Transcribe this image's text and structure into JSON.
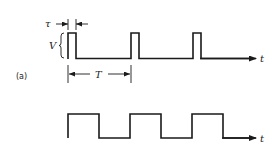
{
  "figure": {
    "panel_label": "(a)",
    "top_waveform": {
      "type": "pulse-train",
      "pulse_width_label": "τ",
      "amplitude_label": "V",
      "period_label": "T",
      "axis_label": "t",
      "pulse_count": 3
    },
    "bottom_waveform": {
      "type": "square-wave",
      "axis_label": "t",
      "high_segments": 3
    }
  },
  "colors": {
    "stroke": "#1a1a1a",
    "background": "#ffffff"
  }
}
